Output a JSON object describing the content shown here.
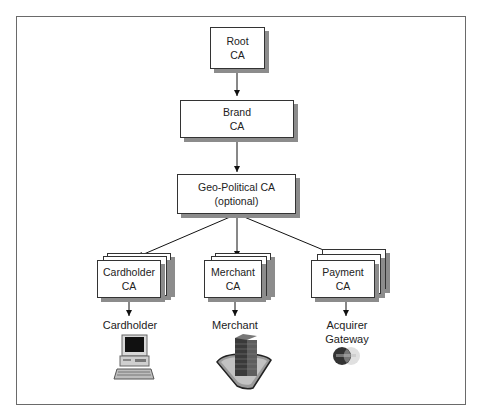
{
  "diagram": {
    "nodes": {
      "root": {
        "line1": "Root",
        "line2": "CA"
      },
      "brand": {
        "line1": "Brand",
        "line2": "CA"
      },
      "geo": {
        "line1": "Geo-Political CA",
        "line2": "(optional)"
      },
      "cardholder_ca": {
        "line1": "Cardholder",
        "line2": "CA"
      },
      "merchant_ca": {
        "line1": "Merchant",
        "line2": "CA"
      },
      "payment_ca": {
        "line1": "Payment",
        "line2": "CA"
      }
    },
    "endpoints": {
      "cardholder": {
        "label": "Cardholder",
        "icon": "computer-icon"
      },
      "merchant": {
        "label": "Merchant",
        "icon": "building-icon"
      },
      "acquirer": {
        "line1": "Acquirer",
        "line2": "Gateway",
        "icon": "card-brand-icon"
      }
    },
    "edges": [
      [
        "Root CA",
        "Brand CA"
      ],
      [
        "Brand CA",
        "Geo-Political CA"
      ],
      [
        "Geo-Political CA",
        "Cardholder CA"
      ],
      [
        "Geo-Political CA",
        "Merchant CA"
      ],
      [
        "Geo-Political CA",
        "Payment CA"
      ],
      [
        "Cardholder CA",
        "Cardholder"
      ],
      [
        "Merchant CA",
        "Merchant"
      ],
      [
        "Payment CA",
        "Acquirer Gateway"
      ]
    ]
  }
}
